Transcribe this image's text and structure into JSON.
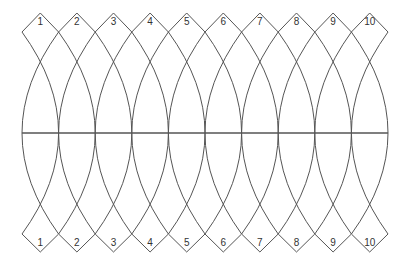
{
  "diagram": {
    "gore_count": 10,
    "top_labels": [
      "1",
      "2",
      "3",
      "4",
      "5",
      "6",
      "7",
      "8",
      "9",
      "10"
    ],
    "bottom_labels": [
      "1",
      "2",
      "3",
      "4",
      "5",
      "6",
      "7",
      "8",
      "9",
      "10"
    ],
    "geometry": {
      "x_start": 22,
      "gore_width": 36.6,
      "top_tip_y": 13,
      "top_side_y": 32,
      "equator_y": 133,
      "bottom_side_y": 234,
      "bottom_tip_y": 252,
      "top_label_y": 25,
      "bottom_label_y": 246
    },
    "colors": {
      "line": "#555555",
      "label": "#333333",
      "background": "#ffffff"
    }
  }
}
